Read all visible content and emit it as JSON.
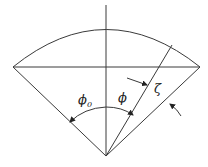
{
  "diagram": {
    "type": "circular-sector-geometry",
    "labels": {
      "phi0_symbol": "ϕ",
      "phi0_subscript": "0",
      "phi": "ϕ",
      "zeta": "ζ"
    },
    "stroke_color": "#3a3a3a",
    "background": "#ffffff"
  }
}
